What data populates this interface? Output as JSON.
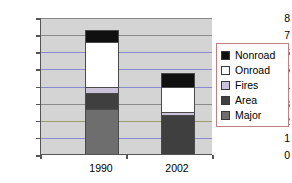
{
  "chart_data": {
    "type": "bar",
    "subtype": "stacked",
    "title": "",
    "xlabel": "",
    "ylabel": "Million tons/year",
    "categories": [
      "1990",
      "2002"
    ],
    "ylim": [
      0,
      8
    ],
    "yticks": [
      "0",
      "1",
      "2",
      "3",
      "4",
      "5",
      "6",
      "7",
      "8"
    ],
    "grid": true,
    "legend_position": "right",
    "series": [
      {
        "name": "Nonroad",
        "color": "#101010",
        "values": [
          0.7,
          0.8
        ]
      },
      {
        "name": "Onroad",
        "color": "#ffffff",
        "values": [
          2.6,
          1.5
        ]
      },
      {
        "name": "Fires",
        "color": "#c9c2d8",
        "values": [
          0.35,
          0.15
        ]
      },
      {
        "name": "Area",
        "color": "#3f3f3f",
        "values": [
          0.95,
          2.35
        ]
      },
      {
        "name": "Major",
        "color": "#6e6e6e",
        "values": [
          2.7,
          0.0
        ]
      }
    ],
    "totals": [
      7.3,
      4.8
    ],
    "plot_background": "#d4d4d4",
    "gridline_color": "#8a8a8a",
    "legend_border_color": "#c08080"
  },
  "legend": {
    "items": [
      {
        "label": "Nonroad"
      },
      {
        "label": "Onroad"
      },
      {
        "label": "Fires"
      },
      {
        "label": "Area"
      },
      {
        "label": "Major"
      }
    ]
  }
}
